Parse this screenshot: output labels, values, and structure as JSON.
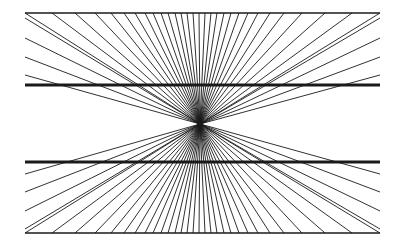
{
  "diagram": {
    "title": "Hering illusion",
    "background": "#ffffff",
    "stroke": "#1a1a1a",
    "vanishing_point": {
      "x": 200,
      "y": 124
    },
    "frame": {
      "x1": 25,
      "x2": 380,
      "top_y": 13,
      "bottom_y": 233
    },
    "thick_lines": [
      {
        "y": 85,
        "x1": 25,
        "x2": 380,
        "width": 3
      },
      {
        "y": 162,
        "x1": 25,
        "x2": 380,
        "width": 3
      }
    ],
    "rays": {
      "top_border_x": [
        25,
        52,
        75,
        95,
        111,
        124,
        135,
        145,
        153,
        161,
        168,
        175,
        181,
        187,
        193,
        199,
        205,
        211,
        217,
        224,
        231,
        239,
        248,
        258,
        270,
        284,
        302,
        325,
        352,
        380
      ],
      "left_edge_y": [
        18,
        38,
        57,
        75,
        174,
        192,
        211,
        229
      ],
      "right_edge_y": [
        18,
        38,
        57,
        75,
        174,
        192,
        211,
        229
      ],
      "bottom_border_x": [
        25,
        52,
        75,
        95,
        111,
        124,
        135,
        145,
        153,
        161,
        168,
        175,
        181,
        187,
        193,
        199,
        205,
        211,
        217,
        224,
        231,
        239,
        248,
        258,
        270,
        284,
        302,
        325,
        352,
        380
      ]
    }
  }
}
